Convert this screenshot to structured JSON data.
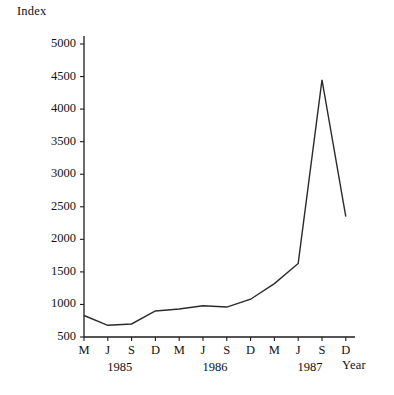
{
  "chart_data": {
    "type": "line",
    "title": "",
    "ylabel": "Index",
    "xlabel": "Year",
    "grid": false,
    "legend": "none",
    "ylim": [
      500,
      5000
    ],
    "yticks": [
      500,
      1000,
      1500,
      2000,
      2500,
      3000,
      3500,
      4000,
      4500,
      5000
    ],
    "ytick_labels": [
      "500",
      "1000",
      "1500",
      "2000",
      "2500",
      "3000",
      "3500",
      "4000",
      "4500",
      "5000"
    ],
    "categories": [
      "M",
      "J",
      "S",
      "D",
      "M",
      "J",
      "S",
      "D",
      "M",
      "J",
      "S",
      "D"
    ],
    "group_labels": [
      "1985",
      "1986",
      "1987"
    ],
    "group_spans": [
      4,
      4,
      4
    ],
    "values": [
      830,
      680,
      700,
      900,
      930,
      980,
      960,
      1080,
      1320,
      1630,
      4450,
      2350
    ],
    "series": [
      {
        "name": "Index",
        "color": "#2b2b2b",
        "values": [
          830,
          680,
          700,
          900,
          930,
          980,
          960,
          1080,
          1320,
          1630,
          4450,
          2350
        ]
      }
    ],
    "points": [
      {
        "x": "M 1985",
        "y": 830
      },
      {
        "x": "J 1985",
        "y": 680
      },
      {
        "x": "S 1985",
        "y": 700
      },
      {
        "x": "D 1985",
        "y": 900
      },
      {
        "x": "M 1986",
        "y": 930
      },
      {
        "x": "J 1986",
        "y": 980
      },
      {
        "x": "S 1986",
        "y": 960
      },
      {
        "x": "D 1986",
        "y": 1080
      },
      {
        "x": "M 1987",
        "y": 1320
      },
      {
        "x": "J 1987",
        "y": 1630
      },
      {
        "x": "S 1987",
        "y": 4450
      },
      {
        "x": "D 1987",
        "y": 2350
      }
    ]
  },
  "colors": {
    "line": "#2b2b2b",
    "axis": "#1c1c1c",
    "text": "#111111",
    "background": "#ffffff"
  }
}
